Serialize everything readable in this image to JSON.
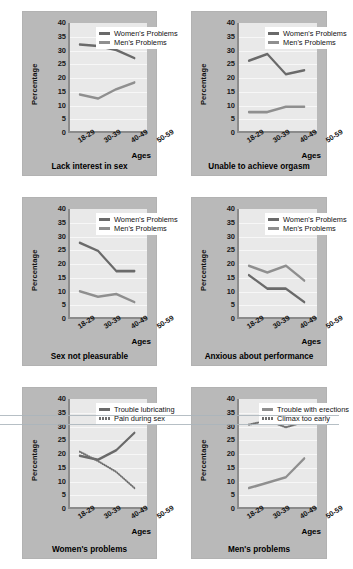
{
  "figure": {
    "axis": {
      "y_label": "Percentage",
      "y_ticks": [
        "40",
        "35",
        "30",
        "25",
        "20",
        "15",
        "10",
        "5",
        "0"
      ],
      "x_ticks": [
        "18-29",
        "30-39",
        "40-49",
        "50-59"
      ],
      "x_axis_label": "Ages",
      "ylim": [
        0,
        40
      ]
    },
    "colors": {
      "panel": "#b9b9b9",
      "plot_background": "#e9e9e9",
      "gridline": "#f7f7f7",
      "axis": "#8b8b8b",
      "series_dark": "#6a6a6a",
      "series_light": "#8f8f8f",
      "dotted": "#6f6f6f"
    }
  },
  "chart_data": [
    {
      "type": "line",
      "title": "Lack interest in sex",
      "xlabel": "Ages",
      "ylabel": "Percentage",
      "ylim": [
        0,
        40
      ],
      "grid": true,
      "legend_position": "top-center",
      "categories": [
        "18-29",
        "30-39",
        "40-49",
        "50-59"
      ],
      "series": [
        {
          "name": "Women's Problems",
          "values": [
            32,
            31.5,
            30,
            27
          ],
          "style": "solid",
          "color": "#6a6a6a"
        },
        {
          "name": "Men's Problems",
          "values": [
            13.5,
            12,
            15.5,
            18
          ],
          "style": "solid",
          "color": "#8f8f8f"
        }
      ]
    },
    {
      "type": "line",
      "title": "Unable to achieve orgasm",
      "xlabel": "Ages",
      "ylabel": "Percentage",
      "ylim": [
        0,
        40
      ],
      "grid": true,
      "legend_position": "top-center",
      "categories": [
        "18-29",
        "30-39",
        "40-49",
        "50-59"
      ],
      "series": [
        {
          "name": "Women's Problems",
          "values": [
            26,
            28.5,
            21,
            22.5
          ],
          "style": "solid",
          "color": "#6a6a6a"
        },
        {
          "name": "Men's Problems",
          "values": [
            7,
            7,
            9,
            9
          ],
          "style": "solid",
          "color": "#8f8f8f"
        }
      ]
    },
    {
      "type": "line",
      "title": "Sex not pleasurable",
      "xlabel": "Ages",
      "ylabel": "Percentage",
      "ylim": [
        0,
        40
      ],
      "grid": true,
      "legend_position": "top-center",
      "categories": [
        "18-29",
        "30-39",
        "40-49",
        "50-59"
      ],
      "series": [
        {
          "name": "Women's Problems",
          "values": [
            27.5,
            24.5,
            17,
            17
          ],
          "style": "solid",
          "color": "#6a6a6a"
        },
        {
          "name": "Men's Problems",
          "values": [
            9.5,
            7.5,
            8.5,
            5.5
          ],
          "style": "solid",
          "color": "#8f8f8f"
        }
      ]
    },
    {
      "type": "line",
      "title": "Anxious about performance",
      "xlabel": "Ages",
      "ylabel": "Percentage",
      "ylim": [
        0,
        40
      ],
      "grid": true,
      "legend_position": "top-center",
      "categories": [
        "18-29",
        "30-39",
        "40-49",
        "50-59"
      ],
      "series": [
        {
          "name": "Women's Problems",
          "values": [
            15.5,
            10.5,
            10.5,
            5.5
          ],
          "style": "solid",
          "color": "#6a6a6a"
        },
        {
          "name": "Men's Problems",
          "values": [
            19,
            16.5,
            19,
            13.5
          ],
          "style": "solid",
          "color": "#8f8f8f"
        }
      ]
    },
    {
      "type": "line",
      "title": "Women's problems",
      "xlabel": "Ages",
      "ylabel": "Percentage",
      "ylim": [
        0,
        40
      ],
      "grid": true,
      "legend_position": "top-center",
      "categories": [
        "18-29",
        "30-39",
        "40-49",
        "50-59"
      ],
      "series": [
        {
          "name": "Trouble lubricating",
          "values": [
            19,
            17.5,
            21,
            27.5
          ],
          "style": "solid",
          "color": "#6a6a6a"
        },
        {
          "name": "Pain during sex",
          "values": [
            20.5,
            17,
            13,
            7
          ],
          "style": "dotted",
          "color": "#6f6f6f"
        }
      ]
    },
    {
      "type": "line",
      "title": "Men's problems",
      "xlabel": "Ages",
      "ylabel": "Percentage",
      "ylim": [
        0,
        40
      ],
      "grid": true,
      "legend_position": "top-center",
      "categories": [
        "18-29",
        "30-39",
        "40-49",
        "50-59"
      ],
      "series": [
        {
          "name": "Trouble with erections",
          "values": [
            7,
            9,
            11,
            18
          ],
          "style": "solid",
          "color": "#8f8f8f"
        },
        {
          "name": "Climax too early",
          "values": [
            30.5,
            32,
            29.5,
            31.5
          ],
          "style": "dotted",
          "color": "#6f6f6f"
        }
      ]
    }
  ]
}
